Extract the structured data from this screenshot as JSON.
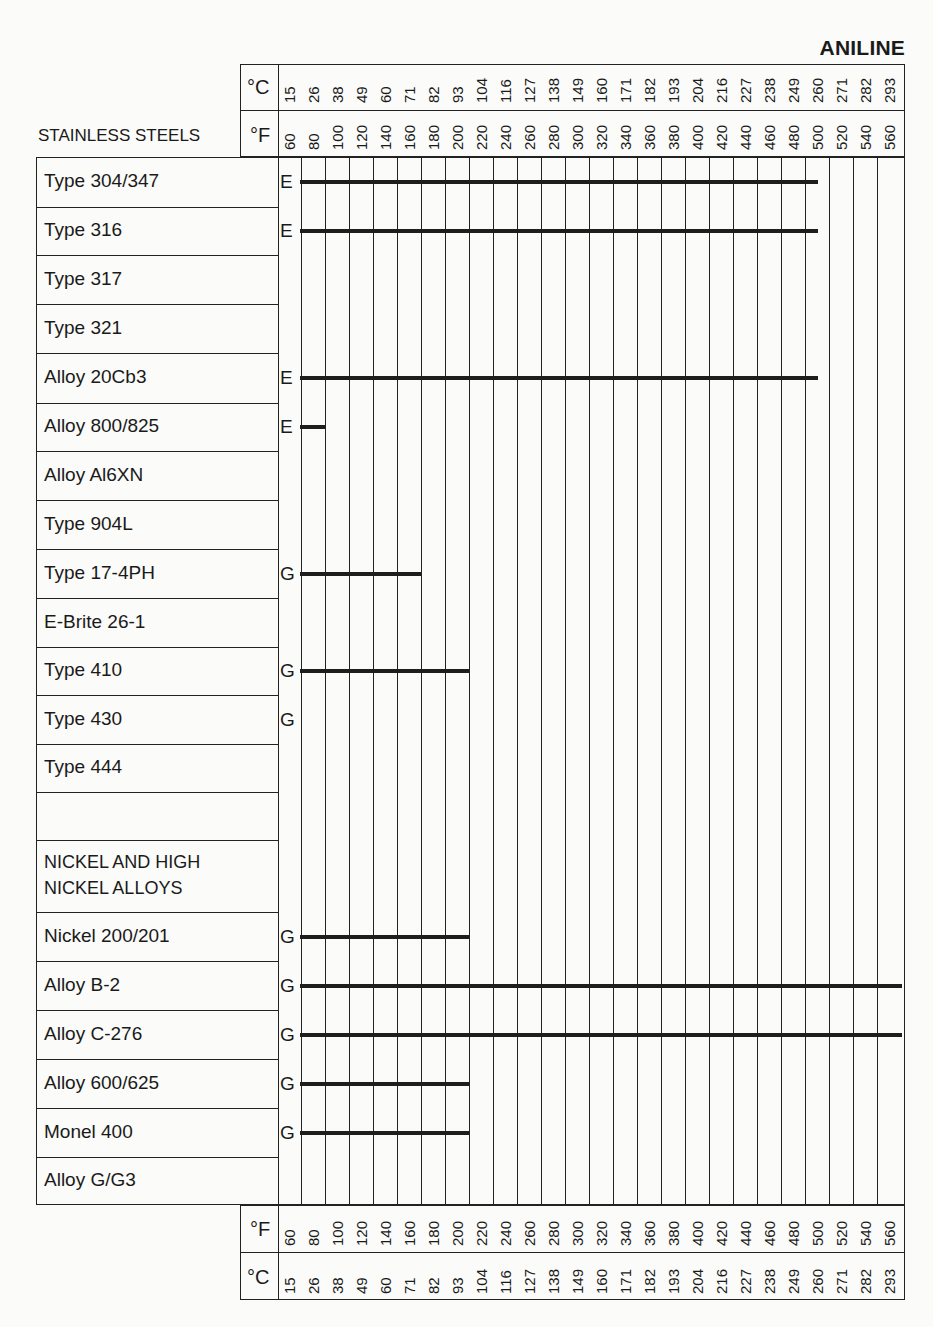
{
  "chart_data": {
    "type": "table",
    "title": "ANILINE",
    "section_header": "STAINLESS STEELS",
    "axis": {
      "celsius_label": "°C",
      "fahrenheit_label": "°F",
      "celsius_ticks": [
        "15",
        "26",
        "38",
        "49",
        "60",
        "71",
        "82",
        "93",
        "104",
        "116",
        "127",
        "138",
        "149",
        "160",
        "171",
        "182",
        "193",
        "204",
        "216",
        "227",
        "238",
        "249",
        "260",
        "271",
        "282",
        "293"
      ],
      "fahrenheit_ticks": [
        "60",
        "80",
        "100",
        "120",
        "140",
        "160",
        "180",
        "200",
        "220",
        "240",
        "260",
        "280",
        "300",
        "320",
        "340",
        "360",
        "380",
        "400",
        "420",
        "440",
        "460",
        "480",
        "500",
        "520",
        "540",
        "560"
      ]
    },
    "legend_note": "Rating letter at left; bar shows temperature range where rating applies",
    "rows": [
      {
        "material": "Type 304/347",
        "rating": "E",
        "from_f": 60,
        "to_f": 500
      },
      {
        "material": "Type 316",
        "rating": "E",
        "from_f": 60,
        "to_f": 500
      },
      {
        "material": "Type 317",
        "rating": "",
        "from_f": null,
        "to_f": null
      },
      {
        "material": "Type 321",
        "rating": "",
        "from_f": null,
        "to_f": null
      },
      {
        "material": "Alloy 20Cb3",
        "rating": "E",
        "from_f": 60,
        "to_f": 500
      },
      {
        "material": "Alloy 800/825",
        "rating": "E",
        "from_f": 60,
        "to_f": 80
      },
      {
        "material": "Alloy Al6XN",
        "rating": "",
        "from_f": null,
        "to_f": null
      },
      {
        "material": "Type 904L",
        "rating": "",
        "from_f": null,
        "to_f": null
      },
      {
        "material": "Type 17-4PH",
        "rating": "G",
        "from_f": 60,
        "to_f": 160
      },
      {
        "material": "E-Brite 26-1",
        "rating": "",
        "from_f": null,
        "to_f": null
      },
      {
        "material": "Type 410",
        "rating": "G",
        "from_f": 60,
        "to_f": 200
      },
      {
        "material": "Type 430",
        "rating": "G",
        "from_f": null,
        "to_f": null
      },
      {
        "material": "Type 444",
        "rating": "",
        "from_f": null,
        "to_f": null
      },
      {
        "material": "",
        "rating": "",
        "from_f": null,
        "to_f": null
      },
      {
        "material": "NICKEL AND HIGH NICKEL ALLOYS",
        "rating": "",
        "from_f": null,
        "to_f": null
      },
      {
        "material": "Nickel 200/201",
        "rating": "G",
        "from_f": 60,
        "to_f": 200
      },
      {
        "material": "Alloy B-2",
        "rating": "G",
        "from_f": 60,
        "to_f": 560
      },
      {
        "material": "Alloy C-276",
        "rating": "G",
        "from_f": 60,
        "to_f": 560
      },
      {
        "material": "Alloy 600/625",
        "rating": "G",
        "from_f": 60,
        "to_f": 200
      },
      {
        "material": "Monel 400",
        "rating": "G",
        "from_f": 60,
        "to_f": 200
      },
      {
        "material": "Alloy G/G3",
        "rating": "",
        "from_f": null,
        "to_f": null
      }
    ]
  },
  "page": {
    "title": "ANILINE",
    "section_stainless": "STAINLESS STEELS",
    "section_nickel_line1": "NICKEL AND HIGH",
    "section_nickel_line2": "NICKEL ALLOYS"
  }
}
